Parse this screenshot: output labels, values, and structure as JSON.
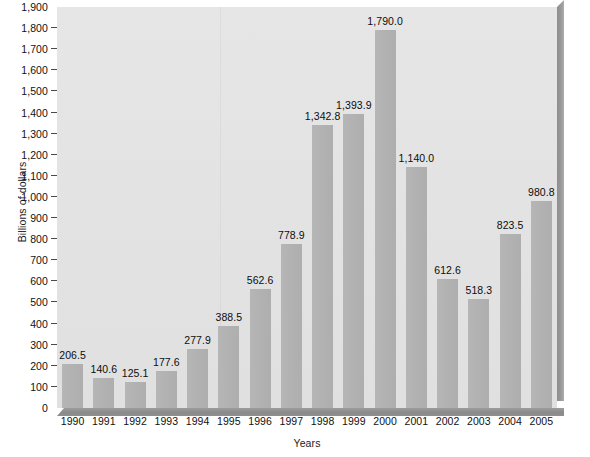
{
  "chart_data": {
    "type": "bar",
    "title": "",
    "xlabel": "Years",
    "ylabel": "Billions of dollars",
    "categories": [
      "1990",
      "1991",
      "1992",
      "1993",
      "1994",
      "1995",
      "1996",
      "1997",
      "1998",
      "1999",
      "2000",
      "2001",
      "2002",
      "2003",
      "2004",
      "2005"
    ],
    "values": [
      206.5,
      140.6,
      125.1,
      177.6,
      277.9,
      388.5,
      562.6,
      778.9,
      1342.8,
      1393.9,
      1790.0,
      1140.0,
      612.6,
      518.3,
      823.5,
      980.8
    ],
    "value_labels": [
      "206.5",
      "140.6",
      "125.1",
      "177.6",
      "277.9",
      "388.5",
      "562.6",
      "778.9",
      "1,342.8",
      "1,393.9",
      "1,790.0",
      "1,140.0",
      "612.6",
      "518.3",
      "823.5",
      "980.8"
    ],
    "ylim": [
      0,
      1900
    ],
    "ytick_step": 100,
    "ytick_labels": [
      "1,900",
      "1,800",
      "1,700",
      "1,600",
      "1,500",
      "1,400",
      "1,300",
      "1,200",
      "1,100",
      "1,000",
      "900",
      "800",
      "700",
      "600",
      "500",
      "400",
      "300",
      "200",
      "100",
      "0"
    ],
    "ytick_values": [
      1900,
      1800,
      1700,
      1600,
      1500,
      1400,
      1300,
      1200,
      1100,
      1000,
      900,
      800,
      700,
      600,
      500,
      400,
      300,
      200,
      100,
      0
    ],
    "grid": false,
    "legend": null,
    "colors": {
      "bar": "#b2b2b2",
      "plot_background": "#e3e3e3",
      "page_background": "#ffffff",
      "base_shadow": "#8d8d8d",
      "text": "#111111"
    }
  }
}
